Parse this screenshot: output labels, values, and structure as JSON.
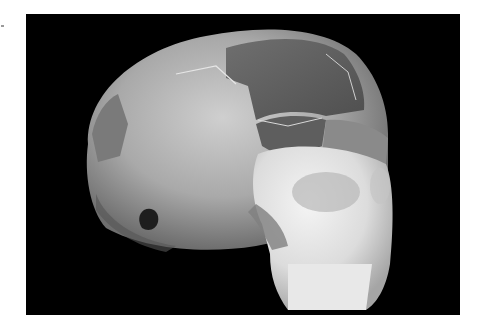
{
  "image": {
    "subject": "reconstructed human skull, three-quarter view",
    "background_color": "#000000",
    "page_background": "#ffffff",
    "alt": "Photograph of a reconstructed fossil skull with patched cranial fragments on a black background"
  }
}
